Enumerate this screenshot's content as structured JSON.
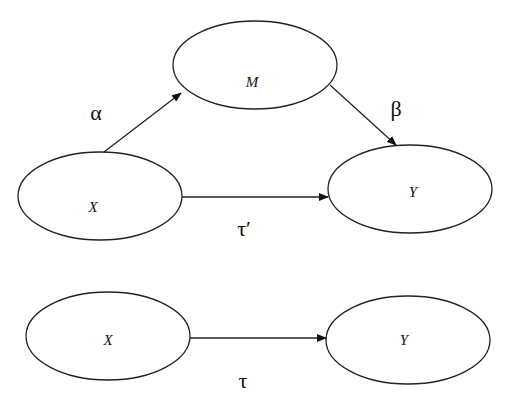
{
  "diagram": {
    "type": "mediation-path-diagram",
    "mediated_model": {
      "nodes": [
        {
          "id": "M",
          "label": "M"
        },
        {
          "id": "X",
          "label": "X"
        },
        {
          "id": "Y",
          "label": "Y"
        }
      ],
      "edges": [
        {
          "from": "X",
          "to": "M",
          "label": "α"
        },
        {
          "from": "M",
          "to": "Y",
          "label": "β"
        },
        {
          "from": "X",
          "to": "Y",
          "label": "τ′"
        }
      ]
    },
    "total_model": {
      "nodes": [
        {
          "id": "X",
          "label": "X"
        },
        {
          "id": "Y",
          "label": "Y"
        }
      ],
      "edges": [
        {
          "from": "X",
          "to": "Y",
          "label": "τ"
        }
      ]
    }
  }
}
